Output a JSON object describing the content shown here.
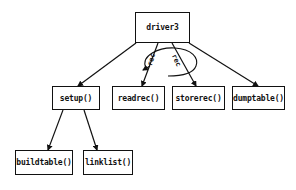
{
  "diagram": {
    "type": "structure chart",
    "nodes": [
      {
        "id": "driver3",
        "label": "driver3"
      },
      {
        "id": "setup",
        "label": "setup()"
      },
      {
        "id": "readrec",
        "label": "readrec()"
      },
      {
        "id": "storerec",
        "label": "storerec()"
      },
      {
        "id": "dumptable",
        "label": "dumptable()"
      },
      {
        "id": "buildtable",
        "label": "buildtable()"
      },
      {
        "id": "linklist",
        "label": "linklist()"
      }
    ],
    "edges": [
      {
        "from": "driver3",
        "to": "setup"
      },
      {
        "from": "driver3",
        "to": "readrec"
      },
      {
        "from": "driver3",
        "to": "storerec"
      },
      {
        "from": "driver3",
        "to": "dumptable"
      },
      {
        "from": "setup",
        "to": "buildtable"
      },
      {
        "from": "setup",
        "to": "linklist"
      }
    ],
    "data_flows": [
      {
        "label": "rec",
        "along": "driver3-readrec"
      },
      {
        "label": "rec",
        "along": "driver3-storerec"
      }
    ],
    "loop": {
      "covers": [
        "readrec",
        "storerec"
      ],
      "shape": "ellipse"
    }
  }
}
